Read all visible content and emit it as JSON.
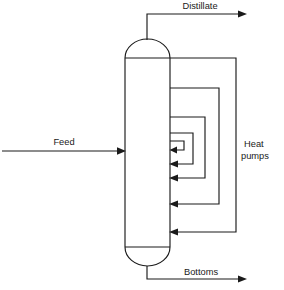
{
  "diagram": {
    "type": "process-flow-diagram",
    "background_color": "#ffffff",
    "line_color": "#1a1a1a",
    "labels": {
      "distillate": "Distillate",
      "feed": "Feed",
      "bottoms": "Bottoms",
      "heat_pumps_line1": "Heat",
      "heat_pumps_line2": "pumps"
    },
    "column": {
      "name": "distillation-column",
      "left_x": 125,
      "right_x": 170,
      "top_y": 40,
      "bottom_y": 265,
      "dome_height": 18,
      "shell_top_y": 58,
      "shell_bottom_y": 247
    },
    "streams": [
      {
        "name": "distillate-stream",
        "label": "Distillate",
        "direction": "out-top",
        "riser_x": 147,
        "riser_top_y": 14,
        "arrow_end_x": 244,
        "arrow_y": 14,
        "label_x": 200,
        "label_y": 9
      },
      {
        "name": "feed-stream",
        "label": "Feed",
        "direction": "in-left",
        "start_x": 2,
        "arrow_end_x": 125,
        "arrow_y": 151,
        "label_x": 62,
        "label_y": 145
      },
      {
        "name": "bottoms-stream",
        "label": "Bottoms",
        "direction": "out-bottom",
        "downcomer_x": 147,
        "downcomer_bottom_y": 279,
        "arrow_end_x": 244,
        "arrow_y": 279,
        "label_x": 200,
        "label_y": 274
      }
    ],
    "heat_pumps": {
      "name": "heat-pump-loop-group",
      "label_line1": "Heat",
      "label_line2": "pumps",
      "label_x": 247,
      "label_y1": 145,
      "label_y2": 157,
      "count": 4,
      "loops": [
        {
          "name": "heat-pump-loop-1",
          "index": 1,
          "draw_off_y": 58,
          "outer_x": 236,
          "return_y": 232
        },
        {
          "name": "heat-pump-loop-2",
          "index": 2,
          "draw_off_y": 88,
          "outer_x": 219,
          "return_y": 204
        },
        {
          "name": "heat-pump-loop-3",
          "index": 3,
          "draw_off_y": 117,
          "outer_x": 205,
          "return_y": 178
        },
        {
          "name": "heat-pump-loop-4",
          "index": 4,
          "draw_off_y": 133,
          "outer_x": 193,
          "return_y": 164
        },
        {
          "name": "heat-pump-loop-5",
          "index": 5,
          "draw_off_y": 141,
          "outer_x": 184,
          "return_y": 150
        }
      ]
    }
  }
}
